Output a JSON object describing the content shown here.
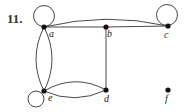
{
  "problem_number": "11.",
  "graph": {
    "vertices": [
      {
        "id": "a",
        "label": "a",
        "x": 44,
        "y": 27
      },
      {
        "id": "b",
        "label": "b",
        "x": 106,
        "y": 27
      },
      {
        "id": "c",
        "label": "c",
        "x": 168,
        "y": 26
      },
      {
        "id": "d",
        "label": "d",
        "x": 106,
        "y": 90
      },
      {
        "id": "e",
        "label": "e",
        "x": 44,
        "y": 91
      },
      {
        "id": "f",
        "label": "f",
        "x": 168,
        "y": 90
      }
    ],
    "edges": [
      {
        "from": "a",
        "to": "a",
        "type": "loop"
      },
      {
        "from": "c",
        "to": "c",
        "type": "loop"
      },
      {
        "from": "e",
        "to": "e",
        "type": "loop"
      },
      {
        "from": "a",
        "to": "b",
        "type": "straight"
      },
      {
        "from": "b",
        "to": "c",
        "type": "straight"
      },
      {
        "from": "a",
        "to": "c",
        "type": "curved"
      },
      {
        "from": "b",
        "to": "d",
        "type": "straight"
      },
      {
        "from": "a",
        "to": "e",
        "type": "curved"
      },
      {
        "from": "a",
        "to": "e",
        "type": "curved"
      },
      {
        "from": "e",
        "to": "d",
        "type": "curved"
      },
      {
        "from": "e",
        "to": "d",
        "type": "curved"
      }
    ]
  }
}
